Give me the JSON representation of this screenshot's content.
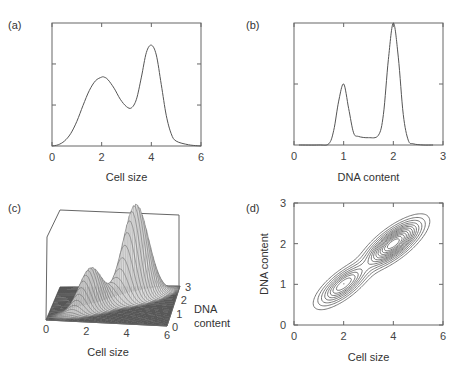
{
  "figure": {
    "panels": [
      "(a)",
      "(b)",
      "(c)",
      "(d)"
    ]
  },
  "chart_data": [
    {
      "panel": "(a)",
      "type": "line",
      "title": "",
      "xlabel": "Cell size",
      "ylabel": "",
      "xlim": [
        0,
        6
      ],
      "xticks": [
        0,
        2,
        4,
        6
      ],
      "yticks_unlabeled": [
        0.333,
        0.667
      ],
      "ylim": [
        0,
        1
      ],
      "description": "Bimodal cell-size distribution",
      "x": [
        0,
        0.25,
        0.5,
        0.75,
        1.0,
        1.25,
        1.5,
        1.75,
        2.0,
        2.1,
        2.25,
        2.5,
        2.75,
        3.0,
        3.2,
        3.4,
        3.6,
        3.8,
        4.0,
        4.2,
        4.4,
        4.6,
        4.8,
        5.0,
        5.5,
        6.0
      ],
      "values": [
        0.0,
        0.01,
        0.04,
        0.1,
        0.2,
        0.33,
        0.45,
        0.53,
        0.56,
        0.56,
        0.54,
        0.47,
        0.38,
        0.32,
        0.31,
        0.38,
        0.56,
        0.76,
        0.82,
        0.74,
        0.5,
        0.25,
        0.1,
        0.04,
        0.01,
        0.0
      ]
    },
    {
      "panel": "(b)",
      "type": "line",
      "title": "",
      "xlabel": "DNA content",
      "ylabel": "",
      "xlim": [
        0,
        3
      ],
      "xticks": [
        0,
        1,
        2,
        3
      ],
      "yticks_unlabeled": [
        0.5
      ],
      "ylim": [
        0,
        1
      ],
      "description": "DNA content histogram with G1 (1) and G2 (2) peaks",
      "x": [
        0.1,
        0.5,
        0.7,
        0.8,
        0.9,
        1.0,
        1.1,
        1.2,
        1.3,
        1.5,
        1.7,
        1.8,
        1.9,
        2.0,
        2.1,
        2.2,
        2.3,
        2.4,
        2.6,
        2.8
      ],
      "values": [
        0.0,
        0.0,
        0.01,
        0.12,
        0.36,
        0.5,
        0.3,
        0.1,
        0.07,
        0.06,
        0.08,
        0.25,
        0.7,
        1.0,
        0.72,
        0.25,
        0.04,
        0.01,
        0.0,
        0.0
      ]
    },
    {
      "panel": "(c)",
      "type": "surface",
      "title": "",
      "xlabel": "Cell size",
      "ylabel": "DNA content",
      "xlim": [
        0,
        6
      ],
      "ylim": [
        0,
        3
      ],
      "xticks": [
        0,
        2,
        4,
        6
      ],
      "yticks": [
        0,
        1,
        2,
        3
      ],
      "description": "3D joint density of cell size and DNA content; peaks near (2,1) and (4,2), the latter higher",
      "peaks": [
        {
          "x": 2,
          "y": 1,
          "height": 0.45
        },
        {
          "x": 4,
          "y": 2,
          "height": 1.0
        }
      ]
    },
    {
      "panel": "(d)",
      "type": "contour",
      "title": "",
      "xlabel": "Cell size",
      "ylabel": "DNA content",
      "xlim": [
        0,
        6
      ],
      "ylim": [
        0,
        3
      ],
      "xticks": [
        0,
        2,
        4,
        6
      ],
      "yticks": [
        0,
        1,
        2,
        3
      ],
      "description": "Contour plot of joint density; centers near (2,1) and (4,2), elongated along the diagonal",
      "centers": [
        {
          "x": 2,
          "y": 1,
          "levels": 5
        },
        {
          "x": 4,
          "y": 2,
          "levels": 8
        }
      ],
      "outer_levels": 3
    }
  ]
}
